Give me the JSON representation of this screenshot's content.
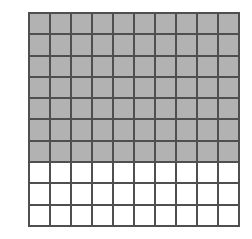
{
  "figure": {
    "grid_label": "hundred-square-grid"
  },
  "chart_data": {
    "type": "heatmap",
    "title": "",
    "xlabel": "",
    "ylabel": "",
    "rows": 10,
    "columns": 10,
    "total_cells": 100,
    "shaded_cells": 70,
    "unshaded_cells": 30,
    "shaded_rows": 7,
    "unshaded_rows": 3,
    "fraction_shaded": "70/100",
    "decimal_shaded": 0.7,
    "percent_shaded": "70%",
    "legend": [],
    "grid": true,
    "values": [
      [
        1,
        1,
        1,
        1,
        1,
        1,
        1,
        1,
        1,
        1
      ],
      [
        1,
        1,
        1,
        1,
        1,
        1,
        1,
        1,
        1,
        1
      ],
      [
        1,
        1,
        1,
        1,
        1,
        1,
        1,
        1,
        1,
        1
      ],
      [
        1,
        1,
        1,
        1,
        1,
        1,
        1,
        1,
        1,
        1
      ],
      [
        1,
        1,
        1,
        1,
        1,
        1,
        1,
        1,
        1,
        1
      ],
      [
        1,
        1,
        1,
        1,
        1,
        1,
        1,
        1,
        1,
        1
      ],
      [
        1,
        1,
        1,
        1,
        1,
        1,
        1,
        1,
        1,
        1
      ],
      [
        0,
        0,
        0,
        0,
        0,
        0,
        0,
        0,
        0,
        0
      ],
      [
        0,
        0,
        0,
        0,
        0,
        0,
        0,
        0,
        0,
        0
      ],
      [
        0,
        0,
        0,
        0,
        0,
        0,
        0,
        0,
        0,
        0
      ]
    ],
    "colors": {
      "shaded": "#b2b2b2",
      "unshaded": "#ffffff",
      "gridline": "#4f4f4f",
      "background": "#ffffff"
    }
  }
}
